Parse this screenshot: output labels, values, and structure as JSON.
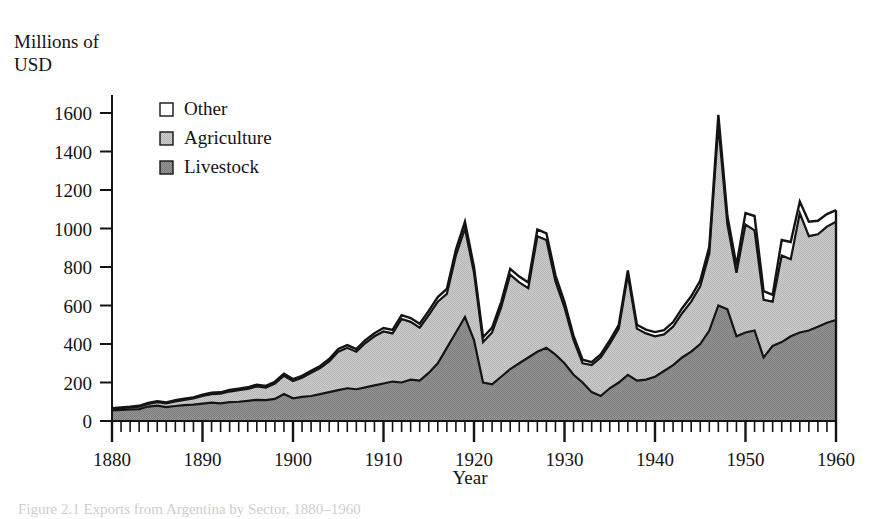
{
  "figure": {
    "ylabel": "Millions of\nUSD",
    "xlabel": "Year",
    "caption": "Figure 2.1  Exports from Argentina by Sector, 1880–1960"
  },
  "legend": {
    "position": "top-left-inside",
    "items": [
      {
        "label": "Other",
        "color": "#ffffff"
      },
      {
        "label": "Agriculture",
        "color": "#c9c9c9"
      },
      {
        "label": "Livestock",
        "color": "#8d8d8d"
      }
    ]
  },
  "axes": {
    "y_ticks": [
      "0",
      "200",
      "400",
      "600",
      "800",
      "1000",
      "1200",
      "1400",
      "1600"
    ],
    "x_ticks": [
      "1880",
      "1890",
      "1900",
      "1910",
      "1920",
      "1930",
      "1940",
      "1950",
      "1960"
    ]
  },
  "chart_data": {
    "type": "area",
    "stacked": true,
    "title": "",
    "xlabel": "Year",
    "ylabel": "Millions of USD",
    "xlim": [
      1880,
      1960
    ],
    "ylim": [
      0,
      1700
    ],
    "yticks": [
      0,
      200,
      400,
      600,
      800,
      1000,
      1200,
      1400,
      1600
    ],
    "xticks": [
      1880,
      1890,
      1900,
      1910,
      1920,
      1930,
      1940,
      1950,
      1960
    ],
    "minor_tick_interval": 1,
    "grid": false,
    "legend": [
      "Other",
      "Agriculture",
      "Livestock"
    ],
    "colors": {
      "Other": "#ffffff",
      "Agriculture": "#c9c9c9",
      "Livestock": "#8d8d8d",
      "outline": "#141414"
    },
    "x": [
      1880,
      1881,
      1882,
      1883,
      1884,
      1885,
      1886,
      1887,
      1888,
      1889,
      1890,
      1891,
      1892,
      1893,
      1894,
      1895,
      1896,
      1897,
      1898,
      1899,
      1900,
      1901,
      1902,
      1903,
      1904,
      1905,
      1906,
      1907,
      1908,
      1909,
      1910,
      1911,
      1912,
      1913,
      1914,
      1915,
      1916,
      1917,
      1918,
      1919,
      1920,
      1921,
      1922,
      1923,
      1924,
      1925,
      1926,
      1927,
      1928,
      1929,
      1930,
      1931,
      1932,
      1933,
      1934,
      1935,
      1936,
      1937,
      1938,
      1939,
      1940,
      1941,
      1942,
      1943,
      1944,
      1945,
      1946,
      1947,
      1948,
      1949,
      1950,
      1951,
      1952,
      1953,
      1954,
      1955,
      1956,
      1957,
      1958,
      1959,
      1960
    ],
    "series": [
      {
        "name": "Livestock",
        "values": [
          55,
          58,
          60,
          62,
          75,
          80,
          72,
          78,
          82,
          85,
          90,
          95,
          92,
          98,
          100,
          105,
          110,
          108,
          115,
          140,
          118,
          125,
          130,
          140,
          150,
          160,
          170,
          165,
          175,
          185,
          195,
          205,
          200,
          215,
          210,
          250,
          300,
          380,
          460,
          540,
          420,
          200,
          190,
          230,
          270,
          300,
          330,
          360,
          380,
          345,
          300,
          240,
          200,
          150,
          130,
          170,
          200,
          240,
          210,
          215,
          230,
          260,
          290,
          330,
          360,
          400,
          470,
          600,
          580,
          440,
          460,
          470,
          330,
          390,
          410,
          440,
          460,
          470,
          490,
          510,
          525
        ]
      },
      {
        "name": "Agriculture",
        "values": [
          8,
          9,
          10,
          12,
          14,
          18,
          20,
          24,
          28,
          32,
          40,
          45,
          50,
          55,
          60,
          62,
          70,
          65,
          80,
          95,
          90,
          100,
          120,
          135,
          160,
          200,
          210,
          195,
          230,
          255,
          270,
          250,
          330,
          300,
          275,
          300,
          320,
          280,
          400,
          460,
          350,
          210,
          270,
          360,
          490,
          420,
          360,
          600,
          560,
          380,
          290,
          180,
          100,
          140,
          200,
          230,
          280,
          520,
          270,
          240,
          210,
          190,
          200,
          230,
          260,
          300,
          400,
          940,
          440,
          330,
          560,
          520,
          300,
          230,
          450,
          400,
          620,
          490,
          480,
          500,
          510
        ]
      },
      {
        "name": "Other",
        "values": [
          4,
          4,
          4,
          5,
          5,
          5,
          5,
          6,
          6,
          6,
          7,
          7,
          7,
          8,
          8,
          8,
          9,
          9,
          9,
          10,
          10,
          10,
          11,
          11,
          12,
          14,
          14,
          14,
          15,
          16,
          18,
          18,
          20,
          20,
          20,
          22,
          24,
          26,
          30,
          35,
          30,
          25,
          25,
          28,
          30,
          30,
          30,
          35,
          35,
          32,
          28,
          22,
          18,
          16,
          16,
          18,
          20,
          22,
          20,
          20,
          22,
          22,
          24,
          26,
          28,
          30,
          35,
          50,
          45,
          38,
          60,
          75,
          45,
          35,
          80,
          90,
          60,
          75,
          70,
          65,
          60
        ]
      }
    ],
    "totals_note": "Stacked total peaks at ~1640 in 1947; trough ~300 in 1932-1933; ~1080 in 1960",
    "annotations": []
  }
}
